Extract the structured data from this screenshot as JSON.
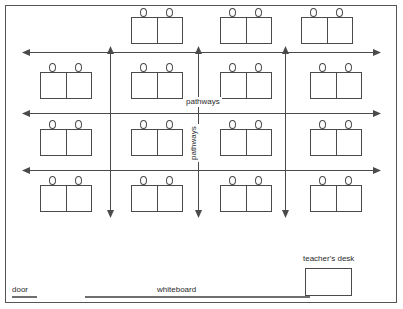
{
  "diagram": {
    "stroke_color": "#4a4a4a",
    "border_color": "#555555",
    "background": "#ffffff"
  },
  "labels": {
    "pathways_horizontal": "pathways",
    "pathways_vertical": "pathways",
    "door": "door",
    "whiteboard": "whiteboard",
    "teachers_desk": "teacher's desk"
  },
  "desks": [
    {
      "id": "desk-r1-c2",
      "row": 1,
      "col": 2,
      "x": 131,
      "y": 8,
      "seats": 2
    },
    {
      "id": "desk-r1-c3",
      "row": 1,
      "col": 3,
      "x": 220,
      "y": 8,
      "seats": 2
    },
    {
      "id": "desk-r1-c4",
      "row": 1,
      "col": 4,
      "x": 301,
      "y": 8,
      "seats": 2
    },
    {
      "id": "desk-r2-c1",
      "row": 2,
      "col": 1,
      "x": 40,
      "y": 63,
      "seats": 2
    },
    {
      "id": "desk-r2-c2",
      "row": 2,
      "col": 2,
      "x": 131,
      "y": 63,
      "seats": 2
    },
    {
      "id": "desk-r2-c3",
      "row": 2,
      "col": 3,
      "x": 220,
      "y": 63,
      "seats": 2
    },
    {
      "id": "desk-r2-c4",
      "row": 2,
      "col": 4,
      "x": 310,
      "y": 63,
      "seats": 2
    },
    {
      "id": "desk-r3-c1",
      "row": 3,
      "col": 1,
      "x": 40,
      "y": 120,
      "seats": 2
    },
    {
      "id": "desk-r3-c2",
      "row": 3,
      "col": 2,
      "x": 131,
      "y": 120,
      "seats": 2
    },
    {
      "id": "desk-r3-c3",
      "row": 3,
      "col": 3,
      "x": 220,
      "y": 120,
      "seats": 2
    },
    {
      "id": "desk-r3-c4",
      "row": 3,
      "col": 4,
      "x": 310,
      "y": 120,
      "seats": 2
    },
    {
      "id": "desk-r4-c1",
      "row": 4,
      "col": 1,
      "x": 40,
      "y": 176,
      "seats": 2
    },
    {
      "id": "desk-r4-c2",
      "row": 4,
      "col": 2,
      "x": 131,
      "y": 176,
      "seats": 2
    },
    {
      "id": "desk-r4-c3",
      "row": 4,
      "col": 3,
      "x": 220,
      "y": 176,
      "seats": 2
    },
    {
      "id": "desk-r4-c4",
      "row": 4,
      "col": 4,
      "x": 310,
      "y": 176,
      "seats": 2
    }
  ],
  "pathways": {
    "horizontal": [
      {
        "id": "h-pathway-1",
        "x1": 25,
        "x2": 378,
        "y": 52
      },
      {
        "id": "h-pathway-2",
        "x1": 25,
        "x2": 378,
        "y": 113
      },
      {
        "id": "h-pathway-3",
        "x1": 25,
        "x2": 378,
        "y": 170
      }
    ],
    "vertical": [
      {
        "id": "v-pathway-1",
        "x": 110,
        "y1": 52,
        "y2": 212
      },
      {
        "id": "v-pathway-2",
        "x": 198,
        "y1": 52,
        "y2": 212
      },
      {
        "id": "v-pathway-3",
        "x": 285,
        "y1": 52,
        "y2": 212
      }
    ]
  },
  "fixtures": {
    "door_wall": {
      "x": 12,
      "y": 296,
      "width": 25
    },
    "whiteboard_wall": {
      "x": 85,
      "y": 296,
      "width": 225
    },
    "teachers_desk_box": {
      "x": 305,
      "y": 268,
      "width": 47,
      "height": 28
    }
  },
  "counts": {
    "total_desk_units": 15,
    "total_seats": 30,
    "rows": 4,
    "columns": 4
  }
}
